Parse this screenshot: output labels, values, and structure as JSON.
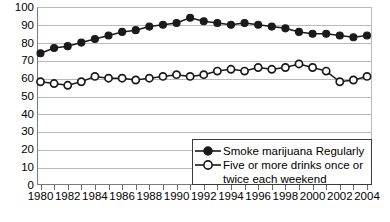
{
  "chart_data": {
    "type": "line",
    "title": "",
    "xlabel": "",
    "ylabel": "",
    "xlim": [
      1980,
      2004
    ],
    "ylim": [
      0,
      100
    ],
    "ytick_step": 10,
    "grid": true,
    "legend_position": "bottom-right",
    "x": [
      1980,
      1981,
      1982,
      1983,
      1984,
      1985,
      1986,
      1987,
      1988,
      1989,
      1990,
      1991,
      1992,
      1993,
      1994,
      1995,
      1996,
      1997,
      1998,
      1999,
      2000,
      2001,
      2002,
      2003,
      2004
    ],
    "xtick_labels": [
      "1980",
      "1982",
      "1984",
      "1986",
      "1988",
      "1990",
      "1992",
      "1994",
      "1996",
      "1998",
      "2000",
      "2002",
      "2004"
    ],
    "ytick_labels": [
      "0",
      "10",
      "20",
      "30",
      "40",
      "50",
      "60",
      "70",
      "80",
      "90",
      "100"
    ],
    "series": [
      {
        "name": "Smoke marijuana Regularly",
        "marker": "filled-circle",
        "color": "#1a1a1a",
        "values": [
          74,
          77,
          78,
          80,
          82,
          84,
          86,
          87,
          89,
          90,
          91,
          94,
          92,
          91,
          90,
          91,
          90,
          89,
          88,
          86,
          85,
          85,
          84,
          83,
          84
        ]
      },
      {
        "name": "Five or more drinks once or twice each weekend",
        "marker": "open-circle",
        "color": "#1a1a1a",
        "values": [
          58,
          57,
          56,
          58,
          61,
          60,
          60,
          59,
          60,
          61,
          62,
          61,
          62,
          64,
          65,
          64,
          66,
          65,
          66,
          68,
          66,
          64,
          58,
          59,
          61
        ]
      }
    ]
  },
  "legend": {
    "entries": [
      {
        "label": "Smoke marijuana Regularly",
        "label2": ""
      },
      {
        "label": "Five or more drinks once or",
        "label2": "twice each weekend"
      }
    ]
  },
  "axis": {
    "y_labels": [
      "100",
      "90",
      "80",
      "70",
      "60",
      "50",
      "40",
      "30",
      "20",
      "10",
      "0"
    ],
    "x_labels": [
      "1980",
      "1982",
      "1984",
      "1986",
      "1988",
      "1990",
      "1992",
      "1994",
      "1996",
      "1998",
      "2000",
      "2002",
      "2004"
    ]
  }
}
